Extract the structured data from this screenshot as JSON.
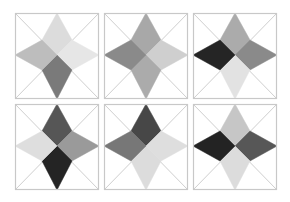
{
  "grid": {
    "rows": 2,
    "cols": 3
  },
  "style": {
    "frame_color": "#c8c8c8",
    "diagonal_color": "#cfcfcf",
    "background": "#ffffff"
  },
  "panels": [
    {
      "id": "p1",
      "x": 15,
      "y": 13,
      "kites": {
        "top": "#dcdcdc",
        "right": "#e6e6e6",
        "bottom": "#7a7a7a",
        "left": "#bdbdbd"
      }
    },
    {
      "id": "p2",
      "x": 104,
      "y": 13,
      "kites": {
        "top": "#a8a8a8",
        "right": "#cfcfcf",
        "bottom": "#ababab",
        "left": "#8a8a8a"
      }
    },
    {
      "id": "p3",
      "x": 193,
      "y": 13,
      "kites": {
        "top": "#ababab",
        "right": "#8a8a8a",
        "bottom": "#e2e2e2",
        "left": "#252525"
      }
    },
    {
      "id": "p4",
      "x": 15,
      "y": 104,
      "kites": {
        "top": "#565656",
        "right": "#9a9a9a",
        "bottom": "#242424",
        "left": "#dedede"
      }
    },
    {
      "id": "p5",
      "x": 104,
      "y": 104,
      "kites": {
        "top": "#474747",
        "right": "#dedede",
        "bottom": "#dcdcdc",
        "left": "#777777"
      }
    },
    {
      "id": "p6",
      "x": 193,
      "y": 104,
      "kites": {
        "top": "#c6c6c6",
        "right": "#575757",
        "bottom": "#dcdcdc",
        "left": "#232323"
      }
    }
  ]
}
